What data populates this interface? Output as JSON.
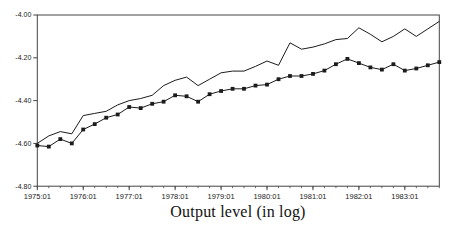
{
  "chart_data": {
    "type": "line",
    "title": "Output level (in log)",
    "xlabel": "",
    "ylabel": "",
    "ylim": [
      -4.8,
      -4.0
    ],
    "grid": false,
    "legend": "none",
    "line_color": "#1c1c1c",
    "axis_color": "#444444",
    "y_tick_labels": [
      "-4.00",
      "-4.20",
      "-4.40",
      "-4.60",
      "-4.80"
    ],
    "x_tick_labels": [
      "1975:01",
      "1976:01",
      "1977:01",
      "1978:01",
      "1979:01",
      "1980:01",
      "1981:01",
      "1982:01",
      "1983:01"
    ],
    "x": [
      "1975:01",
      "1975:02",
      "1975:03",
      "1975:04",
      "1976:01",
      "1976:02",
      "1976:03",
      "1976:04",
      "1977:01",
      "1977:02",
      "1977:03",
      "1977:04",
      "1978:01",
      "1978:02",
      "1978:03",
      "1978:04",
      "1979:01",
      "1979:02",
      "1979:03",
      "1979:04",
      "1980:01",
      "1980:02",
      "1980:03",
      "1980:04",
      "1981:01",
      "1981:02",
      "1981:03",
      "1981:04",
      "1982:01",
      "1982:02",
      "1982:03",
      "1982:04",
      "1983:01",
      "1983:02",
      "1983:03",
      "1983:04"
    ],
    "series": [
      {
        "name": "upper-line-plain",
        "marker": "none",
        "values": [
          -4.6,
          -4.565,
          -4.545,
          -4.555,
          -4.47,
          -4.46,
          -4.45,
          -4.42,
          -4.4,
          -4.39,
          -4.375,
          -4.33,
          -4.305,
          -4.29,
          -4.33,
          -4.3,
          -4.27,
          -4.262,
          -4.262,
          -4.24,
          -4.215,
          -4.235,
          -4.13,
          -4.16,
          -4.15,
          -4.135,
          -4.115,
          -4.11,
          -4.06,
          -4.09,
          -4.125,
          -4.1,
          -4.065,
          -4.1,
          -4.065,
          -4.03
        ]
      },
      {
        "name": "lower-line-square-markers",
        "marker": "square",
        "values": [
          -4.61,
          -4.615,
          -4.58,
          -4.6,
          -4.535,
          -4.51,
          -4.48,
          -4.465,
          -4.43,
          -4.435,
          -4.415,
          -4.405,
          -4.375,
          -4.38,
          -4.405,
          -4.37,
          -4.355,
          -4.345,
          -4.345,
          -4.33,
          -4.325,
          -4.3,
          -4.285,
          -4.285,
          -4.275,
          -4.26,
          -4.23,
          -4.205,
          -4.225,
          -4.245,
          -4.255,
          -4.23,
          -4.26,
          -4.25,
          -4.235,
          -4.22
        ]
      }
    ]
  }
}
